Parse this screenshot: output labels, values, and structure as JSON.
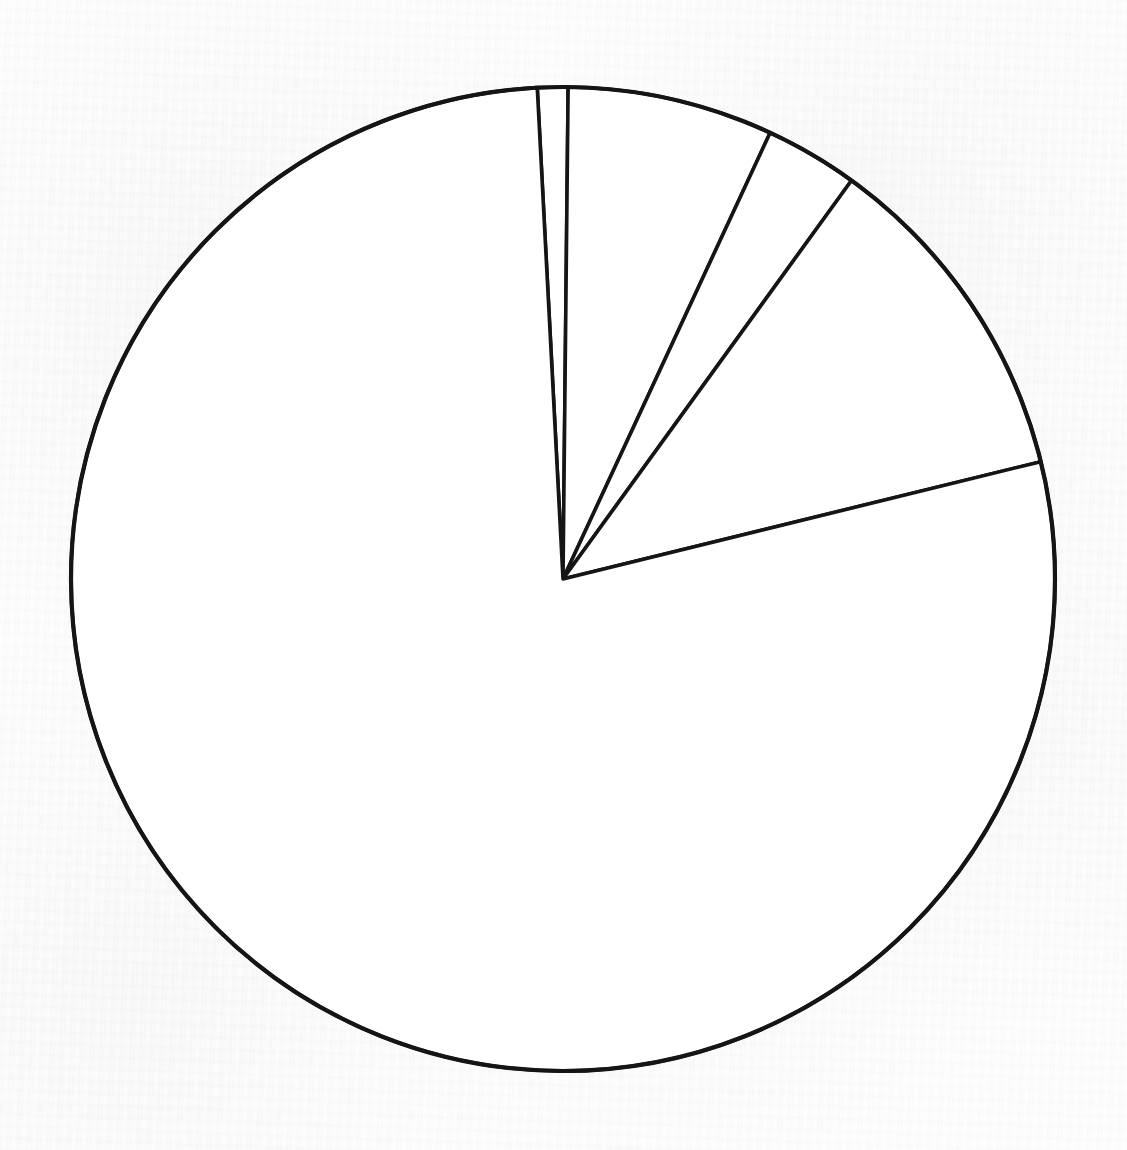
{
  "document": {
    "kind": "scanned-figure",
    "background_color": "#fdfdfd",
    "ink_color": "#151515",
    "title": "",
    "caption": "",
    "axis_labels": [],
    "annotations": []
  },
  "chart_data": {
    "type": "pie",
    "title": "",
    "subtitle": "",
    "xlabel": "",
    "ylabel": "",
    "grid": false,
    "legend_position": "none",
    "labels_shown": false,
    "units": "percent",
    "geometry": {
      "center_x": 563,
      "center_y": 579,
      "radius": 492,
      "start_angle_deg": -3.0,
      "direction": "clockwise",
      "angle_reference": "12 o'clock"
    },
    "style": {
      "fill": "#ffffff",
      "stroke": "#151515",
      "stroke_width": 3.6
    },
    "categories": [
      "Slice 1",
      "Slice 2",
      "Slice 3",
      "Slice 4",
      "Slice 5"
    ],
    "values": [
      1.0,
      6.8,
      3.1,
      11.2,
      78.0
    ],
    "angles_deg": [
      3.6,
      24.3,
      11.0,
      40.3,
      280.8
    ],
    "boundary_angles_deg": [
      -3.0,
      0.6,
      24.9,
      35.9,
      76.2,
      357.0
    ],
    "slices": [
      {
        "index": 0,
        "label": "",
        "value": 1.0,
        "angle_deg": 3.6,
        "start_angle_deg": -3.0,
        "end_angle_deg": 0.6,
        "fill": "#ffffff"
      },
      {
        "index": 1,
        "label": "",
        "value": 6.8,
        "angle_deg": 24.3,
        "start_angle_deg": 0.6,
        "end_angle_deg": 24.9,
        "fill": "#ffffff"
      },
      {
        "index": 2,
        "label": "",
        "value": 3.1,
        "angle_deg": 11.0,
        "start_angle_deg": 24.9,
        "end_angle_deg": 35.9,
        "fill": "#ffffff"
      },
      {
        "index": 3,
        "label": "",
        "value": 11.2,
        "angle_deg": 40.3,
        "start_angle_deg": 35.9,
        "end_angle_deg": 76.2,
        "fill": "#ffffff"
      },
      {
        "index": 4,
        "label": "",
        "value": 78.0,
        "angle_deg": 280.8,
        "start_angle_deg": 76.2,
        "end_angle_deg": 357.0,
        "fill": "#ffffff"
      }
    ]
  }
}
